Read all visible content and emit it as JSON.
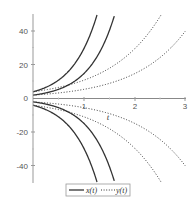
{
  "chart_data": {
    "type": "line",
    "title": "",
    "xlabel": "t",
    "ylabel": "",
    "xlim": [
      0,
      3
    ],
    "ylim": [
      -50,
      50
    ],
    "x_ticks": [
      1,
      2,
      3
    ],
    "y_ticks": [
      -40,
      -20,
      0,
      20,
      40
    ],
    "grid": false,
    "legend_position": "bottom",
    "series": [
      {
        "name": "x(t)",
        "style": "solid",
        "formula": "4*exp(2t)",
        "points": [
          [
            0,
            4
          ],
          [
            0.5,
            10.9
          ],
          [
            1,
            29.6
          ],
          [
            1.24,
            50
          ]
        ]
      },
      {
        "name": "x(t)",
        "style": "solid",
        "formula": "2*exp(2t)",
        "points": [
          [
            0,
            2
          ],
          [
            0.5,
            5.4
          ],
          [
            1,
            14.8
          ],
          [
            1.59,
            50
          ]
        ]
      },
      {
        "name": "x(t)",
        "style": "solid",
        "formula": "-2*exp(2t)",
        "points": [
          [
            0,
            -2
          ],
          [
            0.5,
            -5.4
          ],
          [
            1,
            -14.8
          ],
          [
            1.59,
            -50
          ]
        ]
      },
      {
        "name": "x(t)",
        "style": "solid",
        "formula": "-4*exp(2t)",
        "points": [
          [
            0,
            -4
          ],
          [
            0.5,
            -10.9
          ],
          [
            1,
            -29.6
          ],
          [
            1.24,
            -50
          ]
        ]
      },
      {
        "name": "y(t)",
        "style": "dotted",
        "formula": "4*exp(t)",
        "points": [
          [
            0,
            4
          ],
          [
            1,
            10.9
          ],
          [
            2,
            29.6
          ],
          [
            2.53,
            50
          ]
        ]
      },
      {
        "name": "y(t)",
        "style": "dotted",
        "formula": "2*exp(t)",
        "points": [
          [
            0,
            2
          ],
          [
            1,
            5.4
          ],
          [
            2,
            14.8
          ],
          [
            3,
            40.2
          ]
        ]
      },
      {
        "name": "y(t)",
        "style": "dotted",
        "formula": "-2*exp(t)",
        "points": [
          [
            0,
            -2
          ],
          [
            1,
            -5.4
          ],
          [
            2,
            -14.8
          ],
          [
            3,
            -40.2
          ]
        ]
      },
      {
        "name": "y(t)",
        "style": "dotted",
        "formula": "-4*exp(t)",
        "points": [
          [
            0,
            -4
          ],
          [
            1,
            -10.9
          ],
          [
            2,
            -29.6
          ],
          [
            2.53,
            -50
          ]
        ]
      }
    ],
    "curves": [
      {
        "a": 4,
        "k": 2,
        "style": "solid"
      },
      {
        "a": 2,
        "k": 2,
        "style": "solid"
      },
      {
        "a": -2,
        "k": 2,
        "style": "solid"
      },
      {
        "a": -4,
        "k": 2,
        "style": "solid"
      },
      {
        "a": 4,
        "k": 1,
        "style": "dotted"
      },
      {
        "a": 2,
        "k": 1,
        "style": "dotted"
      },
      {
        "a": -2,
        "k": 1,
        "style": "dotted"
      },
      {
        "a": -4,
        "k": 1,
        "style": "dotted"
      }
    ],
    "legend": [
      {
        "label": "x(t)",
        "style": "solid"
      },
      {
        "label": "y(t)",
        "style": "dotted"
      }
    ],
    "colors": {
      "curve": "#333333",
      "axis": "#888888",
      "legend_border": "#999999"
    }
  },
  "axes": {
    "x_label": "t",
    "x_tick_labels": [
      "1",
      "2",
      "3"
    ],
    "y_tick_labels": [
      "40",
      "20",
      "0",
      "-20",
      "-40"
    ]
  },
  "legend": {
    "x_label": "x(t)",
    "y_label": "y(t)"
  }
}
